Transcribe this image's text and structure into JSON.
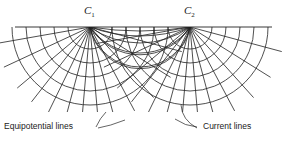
{
  "figure": {
    "electrodes": [
      {
        "name": "C",
        "subscript": "1",
        "x": 90,
        "y": 27
      },
      {
        "name": "C",
        "subscript": "2",
        "x": 190,
        "y": 27
      }
    ],
    "ground_line": {
      "x1": 15,
      "x2": 272,
      "y": 27
    },
    "equipotential_radii": [
      22,
      36,
      50,
      64,
      78
    ],
    "current_line_angles_deg": [
      -80,
      -65,
      -50,
      -38,
      -26,
      -15,
      -5,
      5,
      15,
      28,
      42,
      58,
      75
    ],
    "labels": {
      "equipotential": "Equipotential lines",
      "current": "Current lines"
    },
    "line_color": "#222222"
  }
}
